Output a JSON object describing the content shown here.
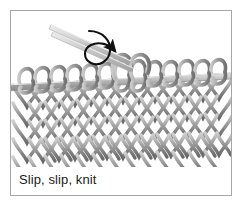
{
  "figure": {
    "caption": "Slip, slip, knit",
    "technique_name": "Slip, slip, knit",
    "colors": {
      "frame_border": "#a6a6a6",
      "background": "#ffffff",
      "yarn_light": "#c9c9c9",
      "yarn_mid": "#9a9a9a",
      "yarn_dark": "#6e6e6e",
      "needle_light": "#d8d8d8",
      "needle_mid": "#a8a8a8",
      "arrow": "#111111",
      "caption_text": "#1a1a1a"
    },
    "elements": {
      "horizontal_needle_label": "working needle holding stitches",
      "angled_needle_label": "left-hand needle tips",
      "arrow_label": "slip-direction arrow",
      "fabric_label": "knitted stockinette fabric"
    },
    "fabric": {
      "stitch_columns": 13,
      "stitch_rows": 6,
      "top_loop_count": 13
    }
  }
}
